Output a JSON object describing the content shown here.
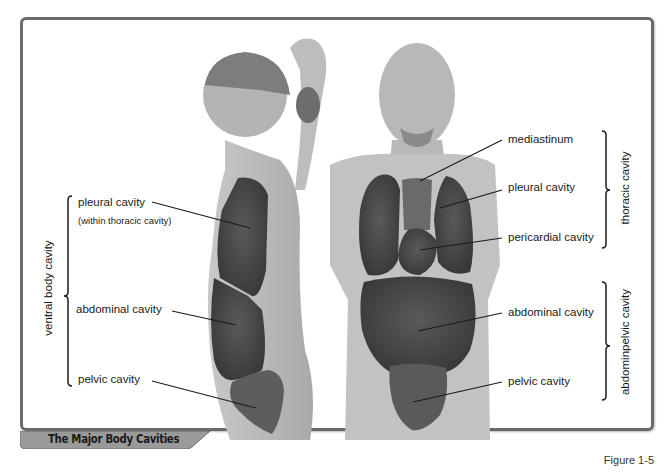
{
  "figure": {
    "title": "The Major Body Cavities",
    "number": "Figure 1-5"
  },
  "left_figure": {
    "view": "lateral",
    "group_label": "ventral body cavity",
    "labels": [
      {
        "text": "pleural cavity",
        "subtext": "(within thoracic cavity)"
      },
      {
        "text": "abdominal cavity"
      },
      {
        "text": "pelvic cavity"
      }
    ]
  },
  "right_figure": {
    "view": "anterior",
    "labels": [
      {
        "text": "mediastinum"
      },
      {
        "text": "pleural cavity"
      },
      {
        "text": "pericardial cavity"
      },
      {
        "text": "abdominal cavity"
      },
      {
        "text": "pelvic cavity"
      }
    ],
    "groups": [
      {
        "text": "thoracic cavity"
      },
      {
        "text": "abdominopelvic cavity",
        "display": "abdominpelvic cavity"
      }
    ]
  },
  "colors": {
    "frame": "#6a6a6a",
    "skin": "#b9b9b9",
    "cavity": "#4a4a4a",
    "caption_bar": "#9a9a9a"
  }
}
